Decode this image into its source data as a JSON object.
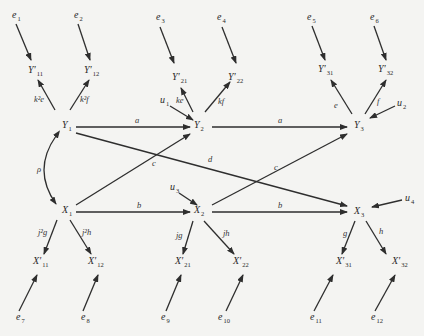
{
  "diagram": {
    "type": "path-diagram",
    "nodes": {
      "e1": {
        "base": "e",
        "sub": "1",
        "prime": false,
        "x": 12,
        "y": 18
      },
      "e2": {
        "base": "e",
        "sub": "2",
        "prime": false,
        "x": 74,
        "y": 18
      },
      "e3": {
        "base": "e",
        "sub": "3",
        "prime": false,
        "x": 156,
        "y": 20
      },
      "e4": {
        "base": "e",
        "sub": "4",
        "prime": false,
        "x": 217,
        "y": 20
      },
      "e5": {
        "base": "e",
        "sub": "5",
        "prime": false,
        "x": 307,
        "y": 20
      },
      "e6": {
        "base": "e",
        "sub": "6",
        "prime": false,
        "x": 370,
        "y": 20
      },
      "Yp11": {
        "base": "Y′",
        "sub": "11",
        "prime": true,
        "x": 28,
        "y": 73
      },
      "Yp12": {
        "base": "Y′",
        "sub": "12",
        "prime": true,
        "x": 84,
        "y": 73
      },
      "Yp21": {
        "base": "Y′",
        "sub": "21",
        "prime": true,
        "x": 172,
        "y": 80
      },
      "Yp22": {
        "base": "Y′",
        "sub": "22",
        "prime": true,
        "x": 228,
        "y": 80
      },
      "Yp31": {
        "base": "Y′",
        "sub": "31",
        "prime": true,
        "x": 318,
        "y": 72
      },
      "Yp32": {
        "base": "Y′",
        "sub": "32",
        "prime": true,
        "x": 378,
        "y": 72
      },
      "Y1": {
        "base": "Y",
        "sub": "1",
        "prime": false,
        "x": 62,
        "y": 128
      },
      "Y2": {
        "base": "Y",
        "sub": "2",
        "prime": false,
        "x": 194,
        "y": 128
      },
      "Y3": {
        "base": "Y",
        "sub": "3",
        "prime": false,
        "x": 354,
        "y": 128
      },
      "X1": {
        "base": "X",
        "sub": "1",
        "prime": false,
        "x": 62,
        "y": 213
      },
      "X2": {
        "base": "X",
        "sub": "2",
        "prime": false,
        "x": 194,
        "y": 213
      },
      "X3": {
        "base": "X",
        "sub": "3",
        "prime": false,
        "x": 354,
        "y": 214
      },
      "Xp11": {
        "base": "X′",
        "sub": "11",
        "prime": true,
        "x": 33,
        "y": 264
      },
      "Xp12": {
        "base": "X′",
        "sub": "12",
        "prime": true,
        "x": 88,
        "y": 264
      },
      "Xp21": {
        "base": "X′",
        "sub": "21",
        "prime": true,
        "x": 175,
        "y": 264
      },
      "Xp22": {
        "base": "X′",
        "sub": "22",
        "prime": true,
        "x": 233,
        "y": 264
      },
      "Xp31": {
        "base": "X′",
        "sub": "31",
        "prime": true,
        "x": 336,
        "y": 264
      },
      "Xp32": {
        "base": "X′",
        "sub": "32",
        "prime": true,
        "x": 392,
        "y": 264
      },
      "e7": {
        "base": "e",
        "sub": "7",
        "prime": false,
        "x": 16,
        "y": 320
      },
      "e8": {
        "base": "e",
        "sub": "8",
        "prime": false,
        "x": 81,
        "y": 320
      },
      "e9": {
        "base": "e",
        "sub": "9",
        "prime": false,
        "x": 161,
        "y": 320
      },
      "e10": {
        "base": "e",
        "sub": "10",
        "prime": false,
        "x": 218,
        "y": 320
      },
      "e11": {
        "base": "e",
        "sub": "11",
        "prime": false,
        "x": 310,
        "y": 320
      },
      "e12": {
        "base": "e",
        "sub": "12",
        "prime": false,
        "x": 371,
        "y": 320
      },
      "u1": {
        "base": "u",
        "sub": "1",
        "prime": false,
        "x": 160,
        "y": 103
      },
      "u2": {
        "base": "u",
        "sub": "2",
        "prime": false,
        "x": 397,
        "y": 106
      },
      "u3": {
        "base": "u",
        "sub": "3",
        "prime": false,
        "x": 170,
        "y": 190
      },
      "u4": {
        "base": "u",
        "sub": "4",
        "prime": false,
        "x": 405,
        "y": 201
      }
    },
    "edge_labels": {
      "k2e": "k²e",
      "k2f": "k²f",
      "ke": "ke",
      "kf": "kf",
      "e": "e",
      "f": "f",
      "a1": "a",
      "a2": "a",
      "b1": "b",
      "b2": "b",
      "c1": "c",
      "c2": "c",
      "d": "d",
      "rho": "ρ",
      "j2g": "j²g",
      "j2h": "j²h",
      "jg": "jg",
      "jh": "jh",
      "g": "g",
      "h": "h"
    },
    "edges": [
      {
        "from": "e1",
        "to": "Yp11"
      },
      {
        "from": "e2",
        "to": "Yp12"
      },
      {
        "from": "e3",
        "to": "Yp21"
      },
      {
        "from": "e4",
        "to": "Yp22"
      },
      {
        "from": "e5",
        "to": "Yp31"
      },
      {
        "from": "e6",
        "to": "Yp32"
      },
      {
        "from": "Y1",
        "to": "Yp11",
        "label": "k²e"
      },
      {
        "from": "Y1",
        "to": "Yp12",
        "label": "k²f"
      },
      {
        "from": "Y2",
        "to": "Yp21",
        "label": "ke"
      },
      {
        "from": "Y2",
        "to": "Yp22",
        "label": "kf"
      },
      {
        "from": "Y3",
        "to": "Yp31",
        "label": "e"
      },
      {
        "from": "Y3",
        "to": "Yp32",
        "label": "f"
      },
      {
        "from": "u1",
        "to": "Y2"
      },
      {
        "from": "u2",
        "to": "Y3"
      },
      {
        "from": "Y1",
        "to": "Y2",
        "label": "a"
      },
      {
        "from": "Y2",
        "to": "Y3",
        "label": "a"
      },
      {
        "from": "X1",
        "to": "X2",
        "label": "b"
      },
      {
        "from": "X2",
        "to": "X3",
        "label": "b"
      },
      {
        "from": "X1",
        "to": "Y2",
        "label": "c"
      },
      {
        "from": "X2",
        "to": "Y3",
        "label": "c"
      },
      {
        "from": "Y1",
        "to": "X3",
        "label": "d"
      },
      {
        "from": "Y1",
        "to": "X1",
        "label": "ρ",
        "bidirectional": true
      },
      {
        "from": "u3",
        "to": "X2"
      },
      {
        "from": "u4",
        "to": "X3"
      },
      {
        "from": "X1",
        "to": "Xp11",
        "label": "j²g"
      },
      {
        "from": "X1",
        "to": "Xp12",
        "label": "j²h"
      },
      {
        "from": "X2",
        "to": "Xp21",
        "label": "jg"
      },
      {
        "from": "X2",
        "to": "Xp22",
        "label": "jh"
      },
      {
        "from": "X3",
        "to": "Xp31",
        "label": "g"
      },
      {
        "from": "X3",
        "to": "Xp32",
        "label": "h"
      },
      {
        "from": "e7",
        "to": "Xp11"
      },
      {
        "from": "e8",
        "to": "Xp12"
      },
      {
        "from": "e9",
        "to": "Xp21"
      },
      {
        "from": "e10",
        "to": "Xp22"
      },
      {
        "from": "e11",
        "to": "Xp31"
      },
      {
        "from": "e12",
        "to": "Xp32"
      }
    ],
    "colors": {
      "background": "#f4f4f2",
      "ink": "#2e2e2e"
    }
  }
}
